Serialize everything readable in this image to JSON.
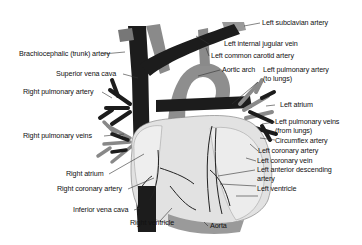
{
  "diagram": {
    "colors": {
      "veins": "#1a1a1a",
      "arteries": "#8a8a8a",
      "heart_muscle": "#d8d8d8",
      "background": "#ffffff"
    },
    "labels": {
      "left_subclavian_artery": "Left subclavian artery",
      "brachiocephalic_artery": "Brachiocephalic (trunk) artery",
      "left_internal_jugular_vein": "Left internal jugular vein",
      "left_common_carotid_artery": "Left common carotid artery",
      "superior_vena_cava": "Superior vena cava",
      "aortic_arch": "Aortic arch",
      "left_pulmonary_artery_1": "Left pulmonary artery",
      "left_pulmonary_artery_2": "(to lungs)",
      "right_pulmonary_artery": "Right pulmonary artery",
      "left_atrium": "Left atrium",
      "right_pulmonary_veins": "Right pulmonary veins",
      "left_pulmonary_veins_1": "Left pulmonary veins",
      "left_pulmonary_veins_2": "(from lungs)",
      "circumflex_artery": "Circumflex artery",
      "left_coronary_artery": "Left coronary artery",
      "left_coronary_vein": "Left coronary vein",
      "right_atrium": "Right atrium",
      "left_anterior_descending_1": "Left anterior descending",
      "left_anterior_descending_2": "artery",
      "right_coronary_artery": "Right coronary artery",
      "left_ventricle": "Left ventricle",
      "inferior_vena_cava": "Inferior vena cava",
      "right_ventricle": "Right ventricle",
      "aorta": "Aorta"
    }
  }
}
